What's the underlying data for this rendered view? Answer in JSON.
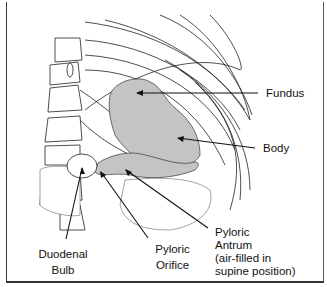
{
  "diagram": {
    "type": "anatomical-illustration",
    "fill_color": "#c4c4c4",
    "line_color": "#111111",
    "labels": [
      {
        "id": "fundus",
        "text": "Fundus"
      },
      {
        "id": "body",
        "text": "Body"
      },
      {
        "id": "duodenal-bulb",
        "lines": [
          "Duodenal",
          "Bulb"
        ]
      },
      {
        "id": "pyloric-orifice",
        "lines": [
          "Pyloric",
          "Orifice"
        ]
      },
      {
        "id": "pyloric-antrum",
        "lines": [
          "Pyloric",
          "Antrum",
          "(air-filled in",
          "supine position)"
        ]
      }
    ]
  }
}
